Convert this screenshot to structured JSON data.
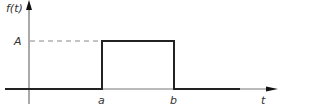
{
  "diagram": {
    "type": "rectangular-pulse",
    "y_axis_label": "f(t)",
    "x_axis_label": "t",
    "amplitude_label": "A",
    "start_label": "a",
    "end_label": "b",
    "colors": {
      "signal": "#222222",
      "axis": "#555555",
      "dashed": "#888888",
      "text": "#333333"
    }
  }
}
